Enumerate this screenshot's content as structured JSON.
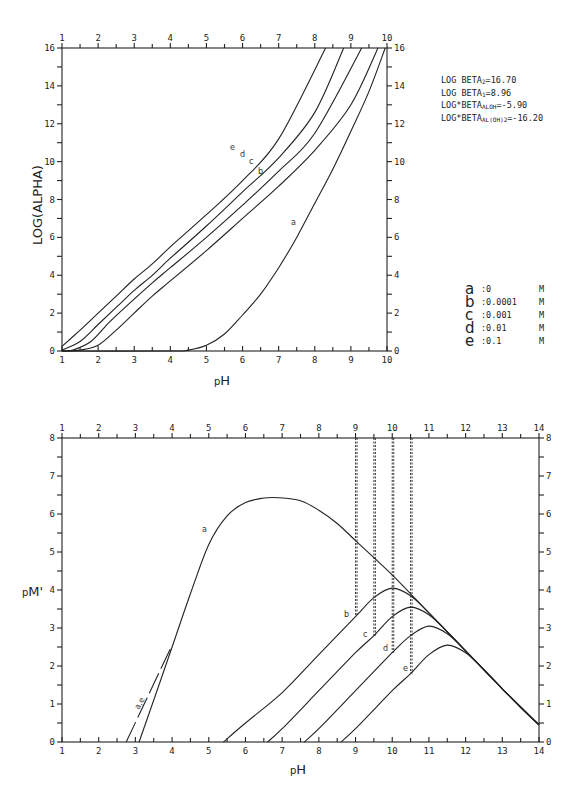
{
  "top_panel": {
    "ylabel": "LOG(ALPHA)",
    "xlabel": "pH",
    "constants": [
      {
        "prefix": "LOG BETA",
        "sub": "2",
        "value": "=16.70"
      },
      {
        "prefix": "LOG BETA",
        "sub": "1",
        "value": "=8.96"
      },
      {
        "prefix": "LOG*BETA",
        "sub": "ALOH",
        "value": "=-5.90"
      },
      {
        "prefix": "LOG*BETA",
        "sub": "AL(OH)2",
        "value": "=-16.20"
      }
    ],
    "legend": [
      {
        "key": "a",
        "conc": ":0",
        "unit": "M"
      },
      {
        "key": "b",
        "conc": ":0.0001",
        "unit": "M"
      },
      {
        "key": "c",
        "conc": ":0.001",
        "unit": "M"
      },
      {
        "key": "d",
        "conc": ":0.01",
        "unit": "M"
      },
      {
        "key": "e",
        "conc": ":0.1",
        "unit": "M"
      }
    ]
  },
  "bottom_panel": {
    "ylabel": "pM'",
    "xlabel": "pH",
    "line_label": "a,e"
  },
  "chart_data": [
    {
      "type": "line",
      "title": "",
      "xlabel": "pH",
      "ylabel": "LOG(ALPHA)",
      "xlim": [
        1,
        10
      ],
      "ylim": [
        0,
        16
      ],
      "x_ticks": [
        1,
        2,
        3,
        4,
        5,
        6,
        7,
        8,
        9,
        10
      ],
      "y_ticks": [
        0,
        2,
        4,
        6,
        8,
        10,
        12,
        14,
        16
      ],
      "grid": false,
      "legend_position": "right",
      "annotations": [
        "LOG BETA2=16.70",
        "LOG BETA1=8.96",
        "LOG*BETA_ALOH=-5.90",
        "LOG*BETA_AL(OH)2=-16.20"
      ],
      "series": [
        {
          "name": "a",
          "label": "a :0 M",
          "x": [
            1,
            4,
            4.5,
            5,
            5.5,
            6,
            6.5,
            7,
            7.5,
            8,
            8.5,
            9,
            9.5,
            9.95
          ],
          "y": [
            0,
            0,
            0.05,
            0.3,
            0.9,
            1.9,
            3.0,
            4.4,
            6.0,
            7.8,
            9.6,
            11.6,
            13.7,
            16
          ]
        },
        {
          "name": "b",
          "label": "b :0.0001 M",
          "x": [
            1,
            1.5,
            2,
            2.5,
            3,
            3.5,
            4,
            5,
            6,
            7,
            8,
            9,
            9.75
          ],
          "y": [
            0,
            0.05,
            0.3,
            1.1,
            2.0,
            2.9,
            3.7,
            5.3,
            7.0,
            8.7,
            10.6,
            13.0,
            16
          ]
        },
        {
          "name": "c",
          "label": "c :0.001 M",
          "x": [
            1,
            1.3,
            1.8,
            2.3,
            2.8,
            3.5,
            4,
            5,
            6,
            7,
            8,
            9.3
          ],
          "y": [
            0,
            0.05,
            0.5,
            1.5,
            2.4,
            3.6,
            4.4,
            6.0,
            7.7,
            9.5,
            11.5,
            16
          ]
        },
        {
          "name": "d",
          "label": "d :0.01 M",
          "x": [
            1,
            1.5,
            2,
            2.5,
            3,
            3.5,
            4,
            5,
            6,
            7,
            8,
            8.8
          ],
          "y": [
            0.05,
            0.5,
            1.4,
            2.3,
            3.2,
            4.0,
            4.9,
            6.6,
            8.4,
            10.2,
            12.6,
            16
          ]
        },
        {
          "name": "e",
          "label": "e :0.1 M",
          "x": [
            1,
            1.5,
            2,
            2.5,
            3,
            3.5,
            4,
            5,
            6,
            7,
            8.3
          ],
          "y": [
            0.25,
            1.1,
            2.0,
            2.9,
            3.8,
            4.6,
            5.5,
            7.2,
            9.0,
            11.2,
            16
          ]
        }
      ]
    },
    {
      "type": "line",
      "title": "",
      "xlabel": "pH",
      "ylabel": "pM'",
      "xlim": [
        1,
        14
      ],
      "ylim": [
        0,
        8
      ],
      "x_ticks": [
        1,
        2,
        3,
        4,
        5,
        6,
        7,
        8,
        9,
        10,
        11,
        12,
        13,
        14
      ],
      "y_ticks": [
        0,
        1,
        2,
        3,
        4,
        5,
        6,
        7,
        8
      ],
      "grid": false,
      "vertical_dashed_lines": [
        {
          "x": 9,
          "y_from": 3.3,
          "y_to": 8
        },
        {
          "x": 9.5,
          "y_from": 2.8,
          "y_to": 8
        },
        {
          "x": 10,
          "y_from": 2.35,
          "y_to": 8
        },
        {
          "x": 10.5,
          "y_from": 1.8,
          "y_to": 8
        }
      ],
      "series": [
        {
          "name": "a",
          "x": [
            3.1,
            3.5,
            4,
            4.5,
            5,
            5.5,
            6,
            6.5,
            6.9,
            7.5,
            8,
            8.5,
            9,
            9.5,
            10,
            10.5,
            11,
            11.5,
            12,
            12.5,
            13,
            13.5,
            14
          ],
          "y": [
            0,
            1.1,
            2.5,
            3.9,
            5.2,
            5.95,
            6.3,
            6.42,
            6.43,
            6.35,
            6.1,
            5.75,
            5.3,
            4.85,
            4.4,
            3.9,
            3.4,
            2.9,
            2.4,
            1.9,
            1.4,
            0.9,
            0.45
          ]
        },
        {
          "name": "b",
          "x": [
            5.4,
            6,
            7,
            8,
            9,
            9.5,
            10,
            10.5,
            11,
            11.5,
            12,
            13,
            14
          ],
          "y": [
            0,
            0.5,
            1.3,
            2.3,
            3.3,
            3.8,
            4.05,
            3.85,
            3.4,
            2.9,
            2.4,
            1.4,
            0.45
          ]
        },
        {
          "name": "c",
          "x": [
            6.6,
            7,
            8,
            9,
            9.5,
            10,
            10.5,
            11,
            11.5,
            12,
            13,
            14
          ],
          "y": [
            0,
            0.35,
            1.35,
            2.35,
            2.8,
            3.3,
            3.55,
            3.35,
            2.9,
            2.4,
            1.4,
            0.45
          ]
        },
        {
          "name": "d",
          "x": [
            7.6,
            8,
            9,
            10,
            10.5,
            11,
            11.5,
            12,
            13,
            14
          ],
          "y": [
            0,
            0.35,
            1.35,
            2.35,
            2.8,
            3.05,
            2.85,
            2.4,
            1.4,
            0.45
          ]
        },
        {
          "name": "e",
          "x": [
            8.6,
            9,
            10,
            10.5,
            11,
            11.5,
            12,
            12.5,
            13,
            14
          ],
          "y": [
            0,
            0.35,
            1.35,
            1.8,
            2.3,
            2.55,
            2.35,
            1.9,
            1.4,
            0.45
          ]
        },
        {
          "name": "a,e slope line",
          "style": "dashed",
          "x": [
            2.75,
            4.0
          ],
          "y": [
            0,
            2.55
          ]
        }
      ]
    }
  ]
}
